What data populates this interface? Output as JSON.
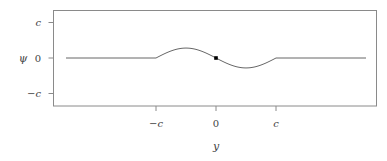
{
  "chart_data": {
    "type": "line",
    "title": "",
    "xlabel": "y",
    "ylabel": "ψ",
    "xticks": [
      {
        "value": -1,
        "label": "−c"
      },
      {
        "value": 0,
        "label": "0"
      },
      {
        "value": 1,
        "label": "c"
      }
    ],
    "yticks": [
      {
        "value": 1,
        "label": "c"
      },
      {
        "value": 0,
        "label": "0"
      },
      {
        "value": -1,
        "label": "−c"
      }
    ],
    "xlim": [
      -2.7,
      2.7
    ],
    "ylim": [
      -1.35,
      1.35
    ],
    "units_note": "values in units of c",
    "grid": false,
    "legend": null,
    "series": [
      {
        "name": "psi",
        "color": "#555555",
        "x": [
          -2.5,
          -1.0,
          -0.875,
          -0.75,
          -0.625,
          -0.5,
          -0.375,
          -0.25,
          -0.125,
          0.0,
          0.125,
          0.25,
          0.375,
          0.5,
          0.625,
          0.75,
          0.875,
          1.0,
          2.5
        ],
        "y": [
          0.0,
          0.0,
          -0.107,
          -0.198,
          -0.259,
          -0.28,
          -0.259,
          -0.198,
          -0.107,
          0.0,
          0.107,
          0.198,
          0.259,
          0.28,
          0.259,
          0.198,
          0.107,
          0.0,
          0.0
        ]
      }
    ],
    "markers": [
      {
        "x": 0,
        "y": 0,
        "shape": "square",
        "color": "#000000"
      }
    ]
  },
  "labels": {
    "x_axis": "y",
    "y_axis": "ψ"
  }
}
